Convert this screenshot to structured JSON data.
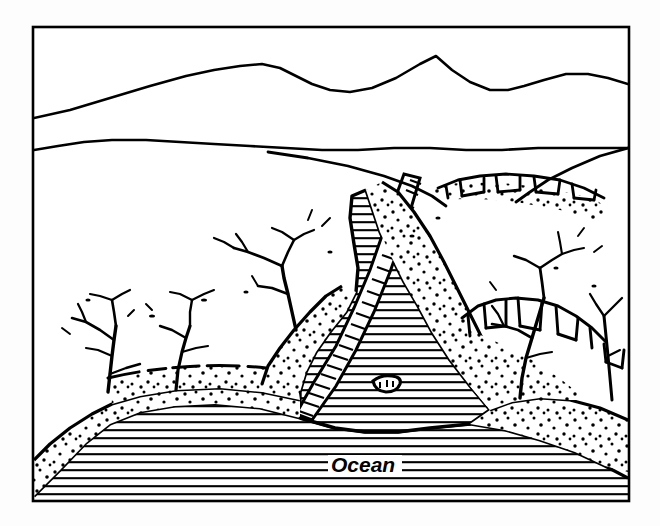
{
  "figure": {
    "type": "geologic-block-diagram",
    "title": "",
    "caption": "",
    "background_color": "#fdfdfd",
    "ink_color": "#000000",
    "paper_color": "#ffffff",
    "frame": {
      "x": 32,
      "y": 26,
      "width": 598,
      "height": 476,
      "stroke_width": 2.5,
      "stroke_color": "#000000"
    },
    "labels": [
      {
        "name": "ocean-label",
        "text": "Ocean",
        "x": 330,
        "y": 472,
        "style": "italic-bold",
        "font_size": 21
      }
    ],
    "legend": {
      "patterns": [
        {
          "name": "horizontal-line-hatch",
          "meaning": "water / ocean surface"
        },
        {
          "name": "stipple-dots",
          "meaning": "unconsolidated sediment / coastal plain"
        },
        {
          "name": "ladder-hatch",
          "meaning": "drowned river channel / estuary"
        },
        {
          "name": "open-white",
          "meaning": "upland bedrock surface"
        }
      ]
    },
    "features": [
      {
        "name": "far-mountain-ridge",
        "description": "distant mountain skyline with a sharp peak"
      },
      {
        "name": "near-ridge-line",
        "description": "second lower ridge crest"
      },
      {
        "name": "upland-plateau",
        "description": "broad white upland surface"
      },
      {
        "name": "estuary-channel",
        "description": "hatched drowned river valley entering the bay"
      },
      {
        "name": "sand-bar-island",
        "description": "small island within the bay"
      },
      {
        "name": "sea-cliff-scarp",
        "description": "blocky cliff faces along valley walls"
      },
      {
        "name": "tributary-network",
        "description": "dendritic tributary stream branches"
      },
      {
        "name": "coastal-terrace",
        "description": "stippled coastal terrace deposits"
      },
      {
        "name": "ocean-body",
        "description": "horizontally ruled ocean area"
      }
    ]
  }
}
